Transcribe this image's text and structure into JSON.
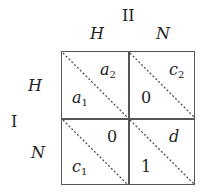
{
  "players": {
    "column": {
      "label": "II",
      "strategies": [
        "H",
        "N"
      ]
    },
    "row": {
      "label": "I",
      "strategies": [
        "H",
        "N"
      ]
    }
  },
  "cells": [
    {
      "row": "H",
      "col": "H",
      "row_payoff": {
        "base": "a",
        "sub": "1"
      },
      "col_payoff": {
        "base": "a",
        "sub": "2"
      }
    },
    {
      "row": "H",
      "col": "N",
      "row_payoff": {
        "base": "0",
        "sub": ""
      },
      "col_payoff": {
        "base": "c",
        "sub": "2"
      }
    },
    {
      "row": "N",
      "col": "H",
      "row_payoff": {
        "base": "c",
        "sub": "1"
      },
      "col_payoff": {
        "base": "0",
        "sub": ""
      }
    },
    {
      "row": "N",
      "col": "N",
      "row_payoff": {
        "base": "1",
        "sub": ""
      },
      "col_payoff": {
        "base": "d",
        "sub": ""
      }
    }
  ]
}
